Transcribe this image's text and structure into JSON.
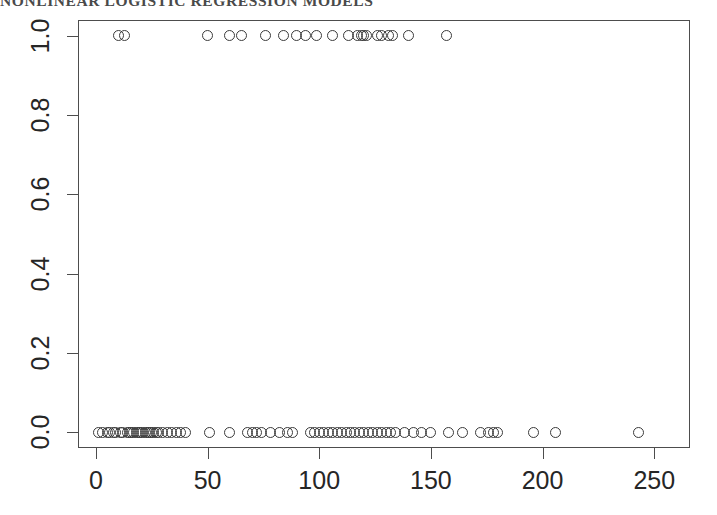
{
  "page": {
    "running_header": "NONLINEAR LOGISTIC REGRESSION MODELS"
  },
  "chart_data": {
    "type": "scatter",
    "title": "",
    "subtitle": "",
    "xlabel": "",
    "ylabel": "",
    "xlim": [
      -8,
      266
    ],
    "ylim": [
      -0.04,
      1.04
    ],
    "grid": false,
    "legend": null,
    "legend_position": "none",
    "xticks": [
      0,
      50,
      100,
      150,
      200,
      250
    ],
    "xtick_labels": [
      "0",
      "50",
      "100",
      "150",
      "200",
      "250"
    ],
    "yticks": [
      0.0,
      0.2,
      0.4,
      0.6,
      0.8,
      1.0
    ],
    "ytick_labels": [
      "0.0",
      "0.2",
      "0.4",
      "0.6",
      "0.8",
      "1.0"
    ],
    "marker": "open-circle",
    "marker_color": "#3b3b3b",
    "marker_size": 11,
    "series": [
      {
        "name": "observations",
        "x": [
          10,
          13,
          50,
          60,
          65,
          76,
          84,
          90,
          94,
          99,
          106,
          113,
          117,
          119,
          120,
          121,
          126,
          128,
          131,
          133,
          140,
          157
        ],
        "y": [
          1,
          1,
          1,
          1,
          1,
          1,
          1,
          1,
          1,
          1,
          1,
          1,
          1,
          1,
          1,
          1,
          1,
          1,
          1,
          1,
          1,
          1
        ]
      },
      {
        "name": "non-observations",
        "x": [
          1,
          3,
          5,
          6,
          8,
          9,
          11,
          12,
          14,
          15,
          16,
          17,
          18,
          19,
          20,
          21,
          22,
          23,
          24,
          25,
          26,
          27,
          28,
          30,
          32,
          34,
          36,
          38,
          40,
          51,
          60,
          68,
          70,
          72,
          74,
          78,
          82,
          86,
          88,
          96,
          98,
          100,
          102,
          104,
          106,
          108,
          110,
          112,
          114,
          116,
          118,
          120,
          122,
          124,
          126,
          128,
          130,
          132,
          134,
          138,
          142,
          146,
          150,
          158,
          164,
          172,
          176,
          178,
          180,
          196,
          206,
          243
        ],
        "y": [
          0,
          0,
          0,
          0,
          0,
          0,
          0,
          0,
          0,
          0,
          0,
          0,
          0,
          0,
          0,
          0,
          0,
          0,
          0,
          0,
          0,
          0,
          0,
          0,
          0,
          0,
          0,
          0,
          0,
          0,
          0,
          0,
          0,
          0,
          0,
          0,
          0,
          0,
          0,
          0,
          0,
          0,
          0,
          0,
          0,
          0,
          0,
          0,
          0,
          0,
          0,
          0,
          0,
          0,
          0,
          0,
          0,
          0,
          0,
          0,
          0,
          0,
          0,
          0,
          0,
          0,
          0,
          0,
          0,
          0,
          0,
          0
        ]
      }
    ]
  }
}
